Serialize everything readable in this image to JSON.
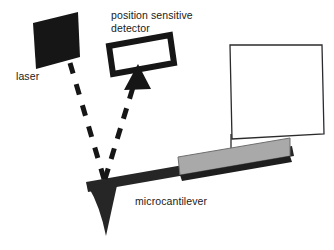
{
  "figure": {
    "kind": "schematic-diagram",
    "background_color": "#ffffff",
    "width": 334,
    "height": 250
  },
  "labels": {
    "detector": "position sensitive\ndetector",
    "detector_line1": "position sensitive",
    "detector_line2": "detector",
    "laser": "laser",
    "cantilever": "microcantilever"
  },
  "colors": {
    "ink": "#1a1a1a",
    "solid_black": "#161616",
    "outline": "#2b2b2b",
    "gray_block": "#a9a9a9",
    "gray_block_edge": "#6f6f6f",
    "dark_bar": "#262626",
    "white": "#ffffff"
  },
  "components": {
    "laser_source": {
      "name": "laser",
      "shape": "filled rotated rectangle",
      "fill": "#161616",
      "center": [
        56,
        41
      ],
      "size": [
        47,
        62
      ],
      "rotation_deg": 20
    },
    "position_sensitive_detector": {
      "name": "position sensitive detector",
      "shape": "hollow rotated rectangle outline",
      "stroke": "#161616",
      "center": [
        140,
        55
      ],
      "size": [
        62,
        24
      ],
      "rotation_deg": 18
    },
    "beam_incident": {
      "name": "incident laser beam",
      "style": "dashed",
      "from": [
        72,
        62
      ],
      "to": [
        104,
        178
      ]
    },
    "beam_reflected": {
      "name": "reflected laser beam",
      "style": "dashed",
      "from": [
        104,
        178
      ],
      "to": [
        131,
        76
      ],
      "arrowhead": "triangle pointing up at detector"
    },
    "cantilever_beam": {
      "name": "microcantilever beam",
      "shape": "slanted dark bar",
      "fill": "#262626",
      "from": [
        88,
        187
      ],
      "to": [
        293,
        152
      ]
    },
    "cantilever_tip": {
      "name": "cantilever probe tip",
      "shape": "downward curved triangle",
      "fill": "#262626",
      "apex": [
        106,
        235
      ]
    },
    "chip_block": {
      "name": "cantilever substrate chip",
      "shape": "gray parallelogram",
      "fill": "#a9a9a9"
    },
    "sample_holder": {
      "name": "sample holder outline",
      "shape": "hollow rotated rectangle outline",
      "stroke": "#2b2b2b",
      "fill": "none"
    },
    "support_line": {
      "name": "vertical support line",
      "stroke": "#2b2b2b"
    }
  }
}
